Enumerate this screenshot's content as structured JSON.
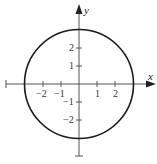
{
  "diagram": {
    "type": "circle-on-axes",
    "equation_shown": false,
    "circle": {
      "center": [
        0,
        0
      ],
      "radius": 3,
      "stroke": "#1a1a1a"
    },
    "axes": {
      "x_label": "x",
      "y_label": "y",
      "color": "#555555",
      "x_ticks": [
        {
          "value": -2,
          "label": "−2"
        },
        {
          "value": -1,
          "label": "−1"
        },
        {
          "value": 1,
          "label": "1"
        },
        {
          "value": 2,
          "label": "2"
        }
      ],
      "y_ticks": [
        {
          "value": 2,
          "label": "2"
        },
        {
          "value": 1,
          "label": "1"
        },
        {
          "value": -1,
          "label": "−1"
        },
        {
          "value": -2,
          "label": "−2"
        }
      ]
    }
  }
}
